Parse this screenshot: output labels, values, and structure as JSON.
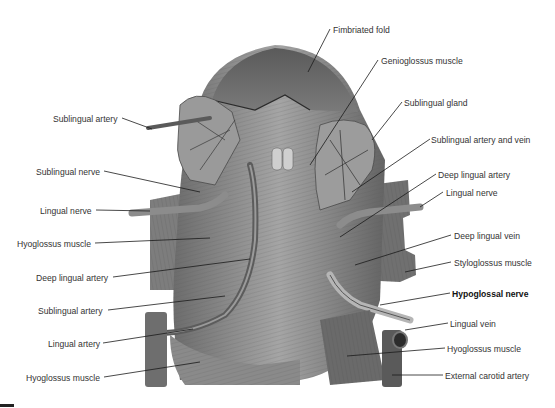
{
  "figure": {
    "colors": {
      "background": "#ffffff",
      "label_text": "#333333",
      "leader_line": "#1a1a1a",
      "tissue_dark": "#4a4a4a",
      "tissue_mid": "#8a8a8a",
      "tissue_light": "#c8c8c8"
    }
  },
  "labels_left": [
    {
      "text": "Sublingual artery",
      "x": 53,
      "y": 114
    },
    {
      "text": "Sublingual nerve",
      "x": 36,
      "y": 167
    },
    {
      "text": "Lingual nerve",
      "x": 40,
      "y": 206
    },
    {
      "text": "Hyoglossus muscle",
      "x": 17,
      "y": 239
    },
    {
      "text": "Deep lingual artery",
      "x": 36,
      "y": 273
    },
    {
      "text": "Sublingual artery",
      "x": 38,
      "y": 306
    },
    {
      "text": "Lingual artery",
      "x": 48,
      "y": 339
    },
    {
      "text": "Hyoglossus muscle",
      "x": 26,
      "y": 373
    }
  ],
  "labels_right": [
    {
      "text": "Fimbriated fold",
      "x": 333,
      "y": 25,
      "bold": false
    },
    {
      "text": "Genioglossus muscle",
      "x": 381,
      "y": 56,
      "bold": false
    },
    {
      "text": "Sublingual gland",
      "x": 404,
      "y": 98,
      "bold": false
    },
    {
      "text": "Sublingual artery and vein",
      "x": 431,
      "y": 135,
      "bold": false
    },
    {
      "text": "Deep lingual artery",
      "x": 438,
      "y": 170,
      "bold": false
    },
    {
      "text": "Lingual nerve",
      "x": 446,
      "y": 188,
      "bold": false
    },
    {
      "text": "Deep lingual vein",
      "x": 454,
      "y": 231,
      "bold": false
    },
    {
      "text": "Styloglossus muscle",
      "x": 454,
      "y": 258,
      "bold": false
    },
    {
      "text": "Hypoglossal nerve",
      "x": 452,
      "y": 289,
      "bold": true
    },
    {
      "text": "Lingual vein",
      "x": 450,
      "y": 319,
      "bold": false
    },
    {
      "text": "Hyoglossus muscle",
      "x": 447,
      "y": 344,
      "bold": false
    },
    {
      "text": "External carotid artery",
      "x": 445,
      "y": 371,
      "bold": false
    }
  ]
}
